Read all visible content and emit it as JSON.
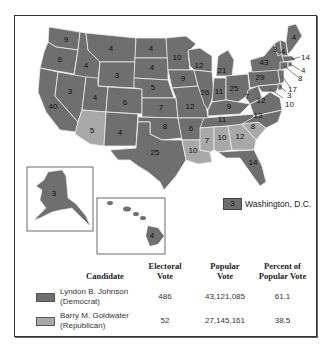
{
  "colors": {
    "democrat": "#6f6f6f",
    "republican": "#a8a8a8",
    "border": "#e8e8e8",
    "text": "#111111"
  },
  "map": {
    "title": "1964 Presidential Election Results",
    "states": [
      {
        "abbr": "WA",
        "ev": "9",
        "party": "D"
      },
      {
        "abbr": "OR",
        "ev": "6",
        "party": "D"
      },
      {
        "abbr": "CA",
        "ev": "40",
        "party": "D"
      },
      {
        "abbr": "ID",
        "ev": "4",
        "party": "D"
      },
      {
        "abbr": "NV",
        "ev": "3",
        "party": "D"
      },
      {
        "abbr": "MT",
        "ev": "4",
        "party": "D"
      },
      {
        "abbr": "WY",
        "ev": "3",
        "party": "D"
      },
      {
        "abbr": "UT",
        "ev": "4",
        "party": "D"
      },
      {
        "abbr": "AZ",
        "ev": "5",
        "party": "R"
      },
      {
        "abbr": "CO",
        "ev": "6",
        "party": "D"
      },
      {
        "abbr": "NM",
        "ev": "4",
        "party": "D"
      },
      {
        "abbr": "ND",
        "ev": "4",
        "party": "D"
      },
      {
        "abbr": "SD",
        "ev": "4",
        "party": "D"
      },
      {
        "abbr": "NE",
        "ev": "5",
        "party": "D"
      },
      {
        "abbr": "KS",
        "ev": "7",
        "party": "D"
      },
      {
        "abbr": "OK",
        "ev": "8",
        "party": "D"
      },
      {
        "abbr": "TX",
        "ev": "25",
        "party": "D"
      },
      {
        "abbr": "MN",
        "ev": "10",
        "party": "D"
      },
      {
        "abbr": "IA",
        "ev": "9",
        "party": "D"
      },
      {
        "abbr": "MO",
        "ev": "12",
        "party": "D"
      },
      {
        "abbr": "AR",
        "ev": "6",
        "party": "D"
      },
      {
        "abbr": "LA",
        "ev": "10",
        "party": "R"
      },
      {
        "abbr": "WI",
        "ev": "12",
        "party": "D"
      },
      {
        "abbr": "IL",
        "ev": "26",
        "party": "D"
      },
      {
        "abbr": "MI",
        "ev": "21",
        "party": "D"
      },
      {
        "abbr": "IN",
        "ev": "13",
        "party": "D"
      },
      {
        "abbr": "OH",
        "ev": "26",
        "party": "D"
      },
      {
        "abbr": "KY",
        "ev": "9",
        "party": "D"
      },
      {
        "abbr": "TN",
        "ev": "11",
        "party": "D"
      },
      {
        "abbr": "MS",
        "ev": "7",
        "party": "R"
      },
      {
        "abbr": "AL",
        "ev": "10",
        "party": "R"
      },
      {
        "abbr": "GA",
        "ev": "12",
        "party": "R"
      },
      {
        "abbr": "FL",
        "ev": "14",
        "party": "D"
      },
      {
        "abbr": "SC",
        "ev": "8",
        "party": "R"
      },
      {
        "abbr": "NC",
        "ev": "13",
        "party": "D"
      },
      {
        "abbr": "VA",
        "ev": "12",
        "party": "D"
      },
      {
        "abbr": "WV",
        "ev": "7",
        "party": "D"
      },
      {
        "abbr": "PA",
        "ev": "29",
        "party": "D"
      },
      {
        "abbr": "NY",
        "ev": "43",
        "party": "D"
      },
      {
        "abbr": "VT",
        "ev": "3",
        "party": "D"
      },
      {
        "abbr": "NH",
        "ev": "4",
        "party": "D"
      },
      {
        "abbr": "ME",
        "ev": "4",
        "party": "D"
      },
      {
        "abbr": "MA",
        "ev": "14",
        "party": "D"
      },
      {
        "abbr": "RI",
        "ev": "4",
        "party": "D"
      },
      {
        "abbr": "CT",
        "ev": "8",
        "party": "D"
      },
      {
        "abbr": "NJ",
        "ev": "17",
        "party": "D"
      },
      {
        "abbr": "DE",
        "ev": "3",
        "party": "D"
      },
      {
        "abbr": "MD",
        "ev": "10",
        "party": "D"
      },
      {
        "abbr": "AK",
        "ev": "3",
        "party": "D"
      },
      {
        "abbr": "HI",
        "ev": "4",
        "party": "D"
      }
    ],
    "labels": {
      "WA": "9",
      "OR": "6",
      "CA": "40",
      "ID": "4",
      "NV": "3",
      "MT": "4",
      "WY": "3",
      "UT": "4",
      "AZ": "5",
      "CO": "6",
      "NM": "4",
      "ND": "4",
      "SD": "4",
      "NE": "5",
      "KS": "7",
      "OK": "8",
      "TX": "25",
      "MN": "10",
      "IA": "9",
      "MO": "12",
      "AR": "6",
      "LA": "10",
      "WI": "12",
      "IL": "26",
      "MI": "21",
      "IN": "11",
      "OH": "25",
      "KY": "9",
      "TN": "11",
      "MS": "7",
      "AL": "10",
      "GA": "12",
      "FL": "14",
      "SC": "8",
      "NC": "13",
      "VA": "12",
      "WV": "7",
      "PA": "29",
      "NY": "43",
      "VT": "3",
      "NH": "4",
      "ME": "4",
      "MA": "14",
      "RI": "4",
      "CT": "8",
      "NJ": "17",
      "DE": "3",
      "MD": "10",
      "AK": "3",
      "HI": "4"
    },
    "dc": {
      "ev": "3",
      "label": "Washington, D.C."
    }
  },
  "legend": {
    "headers": {
      "candidate": "Candidate",
      "electoral_1": "Electoral",
      "electoral_2": "Vote",
      "popular_1": "Popular",
      "popular_2": "Vote",
      "percent_1": "Percent of",
      "percent_2": "Popular Vote"
    },
    "rows": [
      {
        "name_1": "Lyndon B. Johnson",
        "name_2": "(Democrat)",
        "electoral": "486",
        "popular": "43,121,085",
        "percent": "61.1",
        "color": "#6f6f6f"
      },
      {
        "name_1": "Barry M. Goldwater",
        "name_2": "(Republican)",
        "electoral": "52",
        "popular": "27,145,161",
        "percent": "38.5",
        "color": "#a8a8a8"
      }
    ]
  }
}
